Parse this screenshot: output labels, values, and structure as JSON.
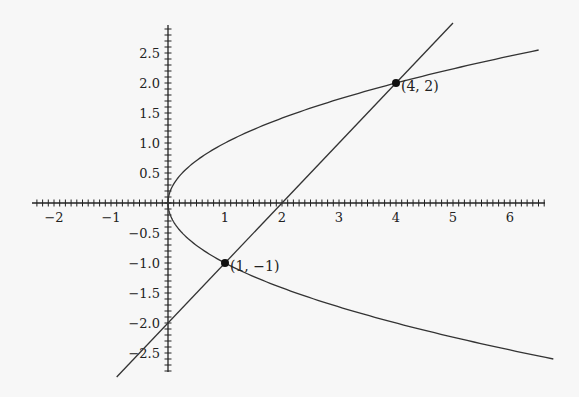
{
  "chart_data": {
    "type": "line",
    "title": "",
    "xlabel": "",
    "ylabel": "",
    "xlim": [
      -2.3,
      6.95
    ],
    "ylim": [
      -2.85,
      2.95
    ],
    "grid": false,
    "legend": null,
    "x_ticks": [
      -2,
      -1,
      1,
      2,
      3,
      4,
      5,
      6
    ],
    "x_tick_labels": [
      "−2",
      "−1",
      "1",
      "2",
      "3",
      "4",
      "5",
      "6"
    ],
    "y_ticks": [
      2.5,
      2.0,
      1.5,
      1.0,
      0.5,
      -0.5,
      -1.0,
      -1.5,
      -2.0,
      -2.5
    ],
    "y_tick_labels": [
      "2.5",
      "2.0",
      "1.5",
      "1.0",
      "0.5",
      "−0.5",
      "−1.0",
      "−1.5",
      "−2.0",
      "−2.5"
    ],
    "minor_tick_step": 0.1,
    "series": [
      {
        "name": "parabola x = y^2",
        "equation": "x = y^2",
        "y_range": [
          -2.6,
          2.55
        ],
        "color": "#333333"
      },
      {
        "name": "line y = x - 2",
        "equation": "y = x - 2",
        "x_range": [
          -0.9,
          5.0
        ],
        "color": "#333333"
      }
    ],
    "points": [
      {
        "x": 4,
        "y": 2,
        "label": "(4, 2)"
      },
      {
        "x": 1,
        "y": -1,
        "label": "(1, −1)"
      }
    ]
  },
  "layout": {
    "origin_px": [
      168,
      203
    ],
    "x_scale": 57,
    "y_scale": 60,
    "x_axis_px": [
      32,
      545
    ],
    "y_axis_px": [
      25,
      372
    ]
  }
}
